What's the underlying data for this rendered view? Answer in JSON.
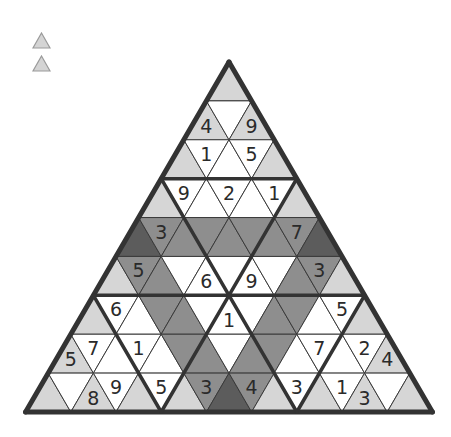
{
  "toolbar": {
    "icons": [
      {
        "name": "triangle-tool-icon-1"
      },
      {
        "name": "triangle-tool-icon-2"
      }
    ]
  },
  "colors": {
    "W": "#ffffff",
    "L": "#d6d6d6",
    "M": "#8e8e8e",
    "D": "#5c5c5c",
    "grid": "#3a3a3a",
    "border": "#333333",
    "text": "#2a2a2a"
  },
  "puzzle": {
    "rows": 9,
    "apex": [
      229,
      62
    ],
    "base_y": 412,
    "half_unit": 22.6,
    "shading": [
      [
        "L"
      ],
      [
        "L",
        "W",
        "L"
      ],
      [
        "L",
        "W",
        "W",
        "W",
        "L"
      ],
      [
        "L",
        "W",
        "W",
        "W",
        "W",
        "W",
        "L"
      ],
      [
        "D",
        "M",
        "M",
        "M",
        "M",
        "M",
        "M",
        "M",
        "D"
      ],
      [
        "L",
        "M",
        "M",
        "W",
        "W",
        "W",
        "W",
        "W",
        "M",
        "M",
        "L"
      ],
      [
        "L",
        "W",
        "W",
        "M",
        "M",
        "W",
        "W",
        "W",
        "M",
        "M",
        "W",
        "W",
        "L"
      ],
      [
        "L",
        "W",
        "W",
        "W",
        "W",
        "M",
        "M",
        "W",
        "M",
        "M",
        "W",
        "W",
        "W",
        "W",
        "L"
      ],
      [
        "L",
        "W",
        "L",
        "W",
        "L",
        "W",
        "L",
        "M",
        "D",
        "M",
        "L",
        "W",
        "L",
        "W",
        "L",
        "W",
        "L"
      ]
    ],
    "digits": [
      [
        ""
      ],
      [
        "4",
        "",
        "9"
      ],
      [
        "",
        "1",
        "",
        "5",
        ""
      ],
      [
        "",
        "9",
        "",
        "2",
        "",
        "1",
        ""
      ],
      [
        "",
        "3",
        "",
        "",
        "",
        "",
        "",
        "7",
        ""
      ],
      [
        "",
        "5",
        "",
        "",
        "6",
        "",
        "9",
        "",
        "",
        "3",
        ""
      ],
      [
        "",
        "6",
        "",
        "",
        "",
        "",
        "1",
        "",
        "",
        "",
        "",
        "5",
        ""
      ],
      [
        "5",
        "7",
        "",
        "1",
        "",
        "",
        "",
        "",
        "",
        "",
        "",
        "7",
        "",
        "2",
        "4"
      ],
      [
        "",
        "",
        "8",
        "9",
        "",
        "5",
        "",
        "3",
        "",
        "4",
        "",
        "3",
        "",
        "1",
        "3",
        "",
        ""
      ]
    ]
  }
}
